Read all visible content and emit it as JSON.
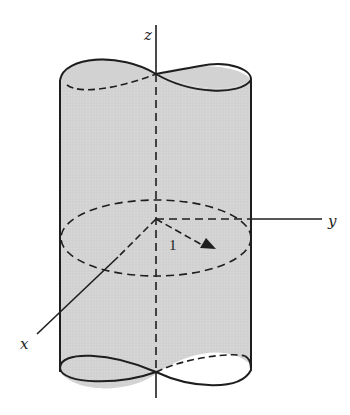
{
  "figure": {
    "axes": {
      "z_label": "z",
      "y_label": "y",
      "x_label": "x"
    },
    "radius_label": "1",
    "colors": {
      "fill": "#d6d6d6",
      "stroke": "#1e1e1e",
      "background": "#ffffff"
    }
  }
}
